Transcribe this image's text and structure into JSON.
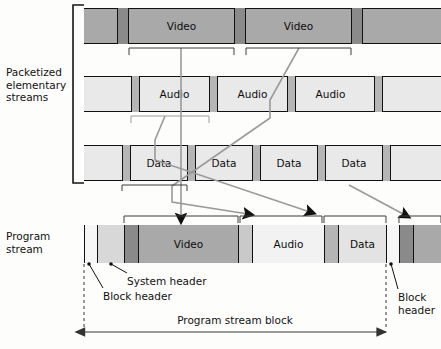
{
  "figure": {
    "palette": {
      "video_bg": "#a9a9a9",
      "video_header": "#8a8a8a",
      "light_bg": "#e9e9e9",
      "light_header": "#b5b5b5",
      "block_header": "#f4f4f4",
      "system_header": "#d8d8d8",
      "outline": "#111111",
      "connector": "#8f8f8f",
      "arrow": "#111111"
    }
  },
  "labels": {
    "packetized": "Packetized\nelementary\nstreams",
    "program_stream": "Program\nstream",
    "system_header": "System header",
    "block_header": "Block header",
    "block_header_right": "Block\nheader",
    "program_stream_block": "Program stream block"
  },
  "streams": [
    {
      "name": "video-stream",
      "label": "Video",
      "y": 8,
      "height": 36,
      "bg": "#a9a9a9",
      "header_color": "#8a8a8a",
      "packets": [
        {
          "header_x": 117,
          "header_w": 12,
          "payload_x": 129,
          "payload_w": 105,
          "label": "Video"
        },
        {
          "header_x": 234,
          "header_w": 12,
          "payload_x": 246,
          "payload_w": 105,
          "label": "Video"
        },
        {
          "header_x": 351,
          "header_w": 12,
          "payload_x": 363,
          "payload_w": 78,
          "label": ""
        }
      ]
    },
    {
      "name": "audio-stream",
      "label": "Audio",
      "y": 76,
      "height": 36,
      "bg": "#e9e9e9",
      "header_color": "#b5b5b5",
      "packets": [
        {
          "header_x": 131,
          "header_w": 9,
          "payload_x": 140,
          "payload_w": 69,
          "label": "Audio"
        },
        {
          "header_x": 209,
          "header_w": 9,
          "payload_x": 218,
          "payload_w": 69,
          "label": "Audio"
        },
        {
          "header_x": 287,
          "header_w": 9,
          "payload_x": 296,
          "payload_w": 69,
          "label": "Audio"
        },
        {
          "header_x": 374,
          "header_w": 9,
          "payload_x": 383,
          "payload_w": 58,
          "label": ""
        }
      ]
    },
    {
      "name": "data-stream",
      "label": "Data",
      "y": 145,
      "height": 36,
      "bg": "#e9e9e9",
      "header_color": "#b5b5b5",
      "packets": [
        {
          "header_x": 122,
          "header_w": 9,
          "payload_x": 131,
          "payload_w": 56,
          "label": "Data"
        },
        {
          "header_x": 187,
          "header_w": 9,
          "payload_x": 196,
          "payload_w": 56,
          "label": "Data"
        },
        {
          "header_x": 252,
          "header_w": 9,
          "payload_x": 261,
          "payload_w": 56,
          "label": "Data"
        },
        {
          "header_x": 317,
          "header_w": 9,
          "payload_x": 326,
          "payload_w": 56,
          "label": "Data"
        },
        {
          "header_x": 382,
          "header_w": 9,
          "payload_x": 391,
          "payload_w": 50,
          "label": ""
        }
      ]
    }
  ],
  "program_stream": {
    "name": "program-stream-row",
    "y": 225,
    "height": 38,
    "segments": [
      {
        "name": "block-header-segment",
        "x": 84,
        "w": 13,
        "color": "#f6f6f6",
        "label": ""
      },
      {
        "name": "system-header-segment",
        "x": 97,
        "w": 27,
        "color": "#d8d8d8",
        "label": ""
      },
      {
        "name": "video-packet-header",
        "x": 124,
        "w": 14,
        "color": "#8a8a8a",
        "label": ""
      },
      {
        "name": "video-packet-payload",
        "x": 138,
        "w": 100,
        "color": "#a9a9a9",
        "label": "Video"
      },
      {
        "name": "audio-packet-header",
        "x": 238,
        "w": 14,
        "color": "#c9c9c9",
        "label": ""
      },
      {
        "name": "audio-packet-payload",
        "x": 252,
        "w": 72,
        "color": "#f2f2f2",
        "label": "Audio"
      },
      {
        "name": "data-packet-header",
        "x": 324,
        "w": 14,
        "color": "#b5b5b5",
        "label": ""
      },
      {
        "name": "data-packet-payload",
        "x": 338,
        "w": 48,
        "color": "#e3e3e3",
        "label": "Data"
      },
      {
        "name": "next-block-header-segment",
        "x": 386,
        "w": 13,
        "color": "#f6f6f6",
        "label": ""
      },
      {
        "name": "next-video-header",
        "x": 399,
        "w": 14,
        "color": "#8a8a8a",
        "label": ""
      },
      {
        "name": "next-video-payload",
        "x": 413,
        "w": 28,
        "color": "#a9a9a9",
        "label": ""
      }
    ]
  },
  "brackets": {
    "side_bracket": {
      "name": "packetized-streams-bracket",
      "x": 73,
      "y": 5,
      "h": 178,
      "w": 11
    },
    "video_row": [
      {
        "x1": 129,
        "x2": 234
      },
      {
        "x1": 246,
        "x2": 351
      }
    ],
    "audio_row": [
      {
        "x1": 131,
        "x2": 209
      }
    ],
    "data_row": [
      {
        "x1": 122,
        "x2": 187
      }
    ],
    "program_row": [
      {
        "x1": 124,
        "x2": 238
      },
      {
        "x1": 240,
        "x2": 322
      },
      {
        "x1": 324,
        "x2": 386
      },
      {
        "x1": 399,
        "x2": 441
      }
    ]
  },
  "connectors": [
    {
      "name": "video1-to-program",
      "points": "181,48 181,218",
      "arrow": true,
      "color": "#9a9a9a"
    },
    {
      "name": "video2-to-program",
      "points": "299,48 270,100 270,118 172,186 172,202 248,214",
      "arrow": true,
      "color": "#9a9a9a"
    },
    {
      "name": "audio-to-program",
      "points": "165,116 155,140 155,160 310,212",
      "arrow": true,
      "color": "#9a9a9a"
    },
    {
      "name": "data-to-program",
      "points": "349,185 405,215",
      "arrow": true,
      "color": "#9a9a9a"
    }
  ],
  "dimension": {
    "name": "program-stream-block-dimension",
    "left_x": 84,
    "right_x": 386,
    "y": 332,
    "label": "Program stream block"
  },
  "callouts": [
    {
      "name": "block-header-callout",
      "dot_x": 89,
      "dot_y": 264,
      "text_x": 103,
      "text_y": 290,
      "label": "Block header"
    },
    {
      "name": "system-header-callout",
      "dot_x": 111,
      "dot_y": 264,
      "text_x": 127,
      "text_y": 275,
      "label": "System header"
    },
    {
      "name": "block-header-right-callout",
      "dot_x": 391,
      "dot_y": 264,
      "text_x": 398,
      "text_y": 291,
      "label": "Block\nheader"
    }
  ]
}
